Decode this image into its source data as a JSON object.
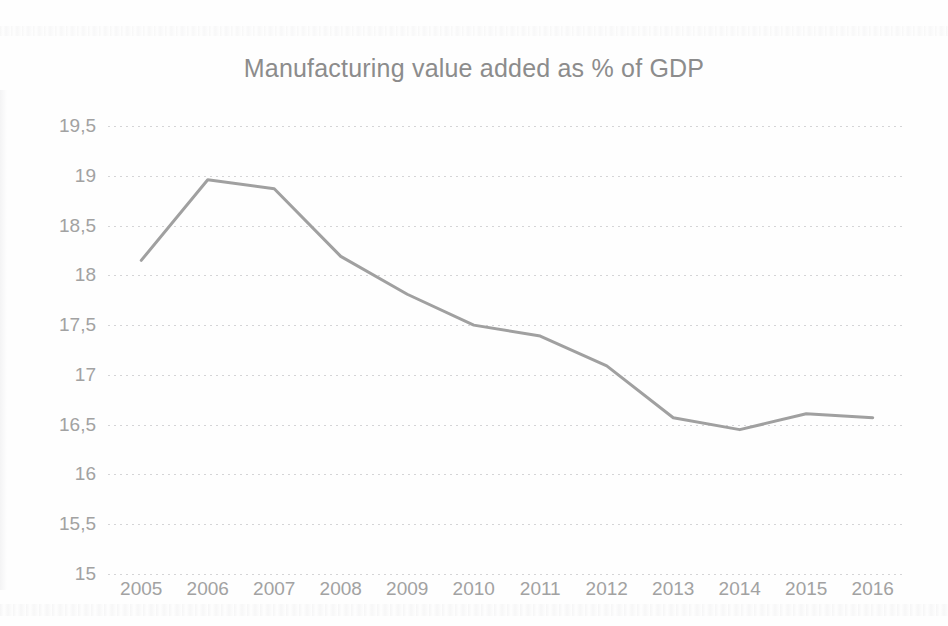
{
  "chart_data": {
    "type": "line",
    "title": "Manufacturing value added as % of GDP",
    "xlabel": "",
    "ylabel": "",
    "categories": [
      "2005",
      "2006",
      "2007",
      "2008",
      "2009",
      "2010",
      "2011",
      "2012",
      "2013",
      "2014",
      "2015",
      "2016"
    ],
    "values": [
      18.15,
      18.96,
      18.87,
      18.19,
      17.81,
      17.5,
      17.39,
      17.09,
      16.57,
      16.45,
      16.61,
      16.57
    ],
    "ylim": [
      15,
      19.5
    ],
    "ytick_labels": [
      "19,5",
      "19",
      "18,5",
      "18",
      "17,5",
      "17",
      "16,5",
      "16",
      "15,5",
      "15"
    ],
    "ytick_values": [
      19.5,
      19,
      18.5,
      18,
      17.5,
      17,
      16.5,
      16,
      15.5,
      15
    ],
    "grid": true,
    "legend": "none",
    "series_color": "#a0a0a0",
    "text_color": "#a2a2a2",
    "title_color": "#8c8c8c",
    "grid_color": "#b2b2b6",
    "background_color": "#fefefe",
    "line_width": 3,
    "markers": false
  }
}
